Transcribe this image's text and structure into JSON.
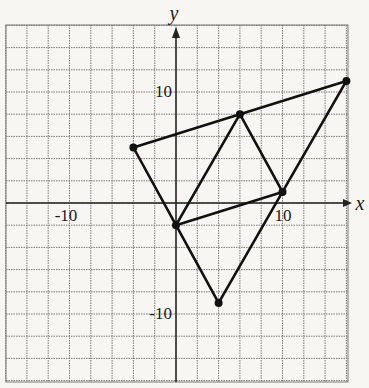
{
  "chart_data": {
    "type": "scatter",
    "title": "",
    "xlabel": "x",
    "ylabel": "y",
    "xlim": [
      -16,
      16
    ],
    "ylim": [
      -16,
      16
    ],
    "grid": true,
    "grid_step": 2,
    "tick_labels": {
      "x": [
        {
          "value": -10,
          "label": "-10"
        },
        {
          "value": 10,
          "label": "10"
        }
      ],
      "y": [
        {
          "value": 10,
          "label": "10"
        },
        {
          "value": -10,
          "label": "-10"
        }
      ]
    },
    "points": [
      {
        "name": "A",
        "x": -4,
        "y": 5
      },
      {
        "name": "B",
        "x": 16,
        "y": 11
      },
      {
        "name": "C",
        "x": 0,
        "y": -2
      },
      {
        "name": "D",
        "x": 6,
        "y": 8
      },
      {
        "name": "E",
        "x": 10,
        "y": 1
      },
      {
        "name": "F",
        "x": 4,
        "y": -9
      }
    ],
    "segments": [
      [
        "A",
        "B"
      ],
      [
        "B",
        "F"
      ],
      [
        "F",
        "C"
      ],
      [
        "C",
        "A"
      ],
      [
        "C",
        "D"
      ],
      [
        "D",
        "E"
      ],
      [
        "E",
        "C"
      ]
    ]
  },
  "labels": {
    "x_axis": "x",
    "y_axis": "y",
    "x_neg10": "-10",
    "x_pos10": "10",
    "y_pos10": "10",
    "y_neg10": "-10"
  }
}
